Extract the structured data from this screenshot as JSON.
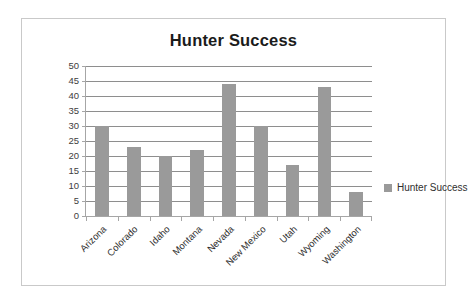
{
  "chart_data": {
    "type": "bar",
    "title": "Hunter Success",
    "xlabel": "",
    "ylabel": "",
    "categories": [
      "Arizona",
      "Colorado",
      "Idaho",
      "Montana",
      "Nevada",
      "New Mexico",
      "Utah",
      "Wyoming",
      "Washington"
    ],
    "values": [
      30,
      23,
      20,
      22,
      44,
      30,
      17,
      43,
      8
    ],
    "series": [
      {
        "name": "Hunter Success",
        "values": [
          30,
          23,
          20,
          22,
          44,
          30,
          17,
          43,
          8
        ]
      }
    ],
    "ylim": [
      0,
      50
    ],
    "ytick_step": 5,
    "yticks": [
      50,
      45,
      40,
      35,
      30,
      25,
      20,
      15,
      10,
      5,
      0
    ],
    "ytick_labels": [
      "50",
      "45",
      "40",
      "35",
      "30",
      "25",
      "20",
      "15",
      "10",
      "5",
      "0"
    ],
    "grid": true,
    "grid_axis": "y",
    "legend": [
      "Hunter Success"
    ],
    "legend_position": "right",
    "bar_color": "#9a9a9a",
    "gridline_color": "#8e8e8e",
    "axis_color": "#a6a6a6",
    "title_color": "#1b1b1b",
    "border_color": "#c9c9c9",
    "background_color": "#ffffff"
  },
  "legend": {
    "entries": [
      {
        "label": "Hunter Success",
        "color": "#9a9a9a"
      }
    ]
  }
}
